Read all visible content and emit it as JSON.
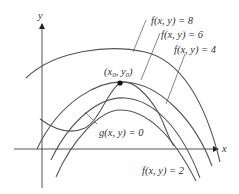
{
  "figure": {
    "axes": {
      "x_label": "x",
      "y_label": "y"
    },
    "level_curves": [
      {
        "label": "f(x, y) = 8",
        "value": 8
      },
      {
        "label": "f(x, y) = 6",
        "value": 6
      },
      {
        "label": "f(x, y) = 4",
        "value": 4
      },
      {
        "label": "f(x, y) = 2",
        "value": 2
      }
    ],
    "constraint_curve": {
      "label": "g(x, y) = 0"
    },
    "point": {
      "label_open": "(x",
      "sub0": "0",
      "comma": ", y",
      "sub1": "0",
      "label_close": ")"
    },
    "colors": {
      "curve": "#555555",
      "point": "#111111",
      "text": "#333333"
    }
  }
}
